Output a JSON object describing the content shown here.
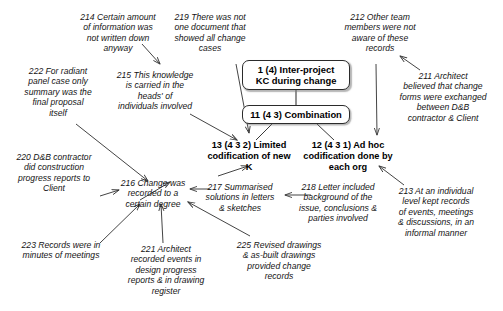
{
  "diagram": {
    "boxes": [
      {
        "id": "node-1",
        "label": "1 (4) Inter-project\nKC during change"
      },
      {
        "id": "node-11",
        "label": "11 (4 3) Combination"
      }
    ],
    "nodes": [
      {
        "id": "node-13",
        "label": "13 (4 3 2) Limited\ncodification of new\nK"
      },
      {
        "id": "node-12",
        "label": "12 (4 3 1) Ad hoc\ncodification done by\neach org"
      }
    ],
    "notes": [
      {
        "id": "note-214",
        "label": "214 Certain amount\nof information was\nnot written down\nanyway"
      },
      {
        "id": "note-219",
        "label": "219 There was not\none document that\nshowed all change\ncases"
      },
      {
        "id": "note-212",
        "label": "212 Other team\nmembers were not\naware of these\nrecords"
      },
      {
        "id": "note-222",
        "label": "222 For radiant\npanel case only\nsummary was the\nfinal proposal\nitself"
      },
      {
        "id": "note-215",
        "label": "215 This knowledge\nis carried in the\nheads' of\nindividuals involved"
      },
      {
        "id": "note-211",
        "label": "211 Architect\nbelieved that change\nforms were exchanged\nbetween D&B\ncontractor & Client"
      },
      {
        "id": "note-220",
        "label": "220 D&B contractor\ndid construction\nprogress reports to\nClient"
      },
      {
        "id": "note-216",
        "label": "216 Change was\nrecorded to a\ncertain degree"
      },
      {
        "id": "note-217",
        "label": "217 Summarised\nsolutions in letters\n& sketches"
      },
      {
        "id": "note-218",
        "label": "218 Letter included\nbackground of the\nissue, conclusions &\nparties involved"
      },
      {
        "id": "note-213",
        "label": "213 At an individual\nlevel kept records\nof events, meetings\n& discussions, in an\ninformal manner"
      },
      {
        "id": "note-223",
        "label": "223 Records were in\nminutes of meetings"
      },
      {
        "id": "note-221",
        "label": "221 Architect\nrecorded events in\ndesign progress\nreports & in drawing\nregister"
      },
      {
        "id": "note-225",
        "label": "225 Revised drawings\n& as-built drawings\nprovided change\nrecords"
      }
    ],
    "colors": {
      "line": "#3a3a3a",
      "box_border": "#2b2b2b",
      "text": "#141414",
      "background": "#ffffff"
    }
  }
}
